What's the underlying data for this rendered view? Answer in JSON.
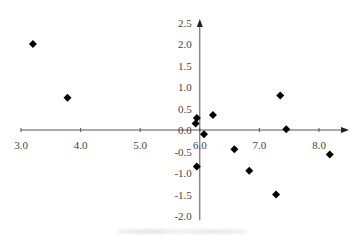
{
  "chart_data": {
    "type": "scatter",
    "title": "",
    "xlabel": "",
    "ylabel": "",
    "marker": "diamond",
    "marker_color": "#000000",
    "axis_color": "#555555",
    "xlim": [
      3.0,
      8.4
    ],
    "ylim": [
      -2.0,
      2.5
    ],
    "x_ticks": [
      3.0,
      4.0,
      5.0,
      6.0,
      7.0,
      8.0
    ],
    "x_tick_labels": [
      "3.0",
      "4.0",
      "5.0",
      "6.0",
      "7.0",
      "8.0"
    ],
    "y_ticks": [
      2.5,
      2.0,
      1.5,
      1.0,
      0.5,
      0.0,
      -0.5,
      -1.0,
      -1.5,
      -2.0
    ],
    "y_tick_labels": [
      "2.5",
      "2.0",
      "1.5",
      "1.0",
      "0.5",
      "0.0",
      "-0.5",
      "-1.0",
      "-1.5",
      "-2.0"
    ],
    "y_axis_crosses_x_at": 6.0,
    "x_axis_crosses_y_at": 0.0,
    "grid": false,
    "legend": null,
    "points": [
      {
        "x": 3.2,
        "y": 2.0
      },
      {
        "x": 3.78,
        "y": 0.75
      },
      {
        "x": 5.95,
        "y": 0.28
      },
      {
        "x": 5.93,
        "y": 0.15
      },
      {
        "x": 6.22,
        "y": 0.35
      },
      {
        "x": 6.07,
        "y": -0.1
      },
      {
        "x": 5.95,
        "y": -0.85
      },
      {
        "x": 6.58,
        "y": -0.45
      },
      {
        "x": 6.83,
        "y": -0.95
      },
      {
        "x": 7.35,
        "y": 0.8
      },
      {
        "x": 7.45,
        "y": 0.02
      },
      {
        "x": 7.28,
        "y": -1.5
      },
      {
        "x": 8.18,
        "y": -0.57
      }
    ],
    "caption": "(illegible)"
  }
}
